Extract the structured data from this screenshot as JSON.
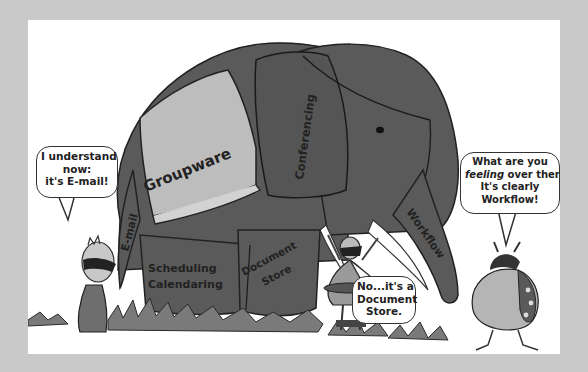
{
  "illustration": {
    "elephant_labels": {
      "saddle": "Groupware",
      "head": "Conferencing",
      "trunk": "E-mail",
      "tusk": "Workflow",
      "front_leg": "Document Store",
      "front_leg_line1": "Document",
      "front_leg_line2": "Store",
      "back_leg_line1": "Scheduling",
      "back_leg_line2": "Calendaring"
    },
    "bubbles": {
      "left": {
        "line1": "I understand",
        "line2": "now:",
        "line3": "it's E-mail!"
      },
      "middle": {
        "line1": "No...it's a",
        "line2": "Document",
        "line3": "Store."
      },
      "right": {
        "line1": "What are you",
        "line2_em": "feeling",
        "line2_rest": " over there?",
        "line3": "It's clearly",
        "line4": "Workflow!"
      }
    },
    "colors": {
      "background": "#c9c9c9",
      "frame": "#ffffff",
      "elephant": "#5a5a5a",
      "saddle": "#bdbdbd",
      "grass": "#7a7a7a",
      "figure_light": "#b5b5b5"
    }
  }
}
